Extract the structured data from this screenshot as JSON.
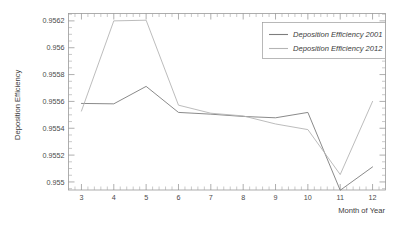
{
  "chart_data": {
    "type": "line",
    "title": "",
    "xlabel": "Month of Year",
    "ylabel": "Deposition Efficiency",
    "x": [
      3,
      4,
      5,
      6,
      7,
      8,
      9,
      10,
      11,
      12
    ],
    "xlim": [
      2.6,
      12.4
    ],
    "ylim": [
      0.95494,
      0.956255
    ],
    "xticks": [
      "3",
      "4",
      "5",
      "6",
      "7",
      "8",
      "9",
      "10",
      "11",
      "12"
    ],
    "yticks": [
      "0.955",
      "0.9552",
      "0.9554",
      "0.9556",
      "0.9558",
      "0.956",
      "0.9562"
    ],
    "ytick_values": [
      0.955,
      0.9552,
      0.9554,
      0.9556,
      0.9558,
      0.956,
      0.9562
    ],
    "grid": false,
    "legend_position": "top-right",
    "series": [
      {
        "name": "Deposition Efficiency 2001",
        "color": "#7d7d7d",
        "values": [
          0.955585,
          0.955582,
          0.955712,
          0.955518,
          0.955505,
          0.955488,
          0.955478,
          0.955518,
          0.954938,
          0.955112
        ]
      },
      {
        "name": "Deposition Efficiency 2012",
        "color": "#b4b4b4",
        "values": [
          0.955528,
          0.9562,
          0.956205,
          0.955572,
          0.955512,
          0.955492,
          0.955432,
          0.95539,
          0.955055,
          0.9556
        ]
      }
    ]
  },
  "axes": {
    "y_title": "Deposition Efficiency",
    "x_title": "Month of Year"
  },
  "legend": {
    "entries": [
      {
        "label": "Deposition Efficiency 2001"
      },
      {
        "label": "Deposition Efficiency 2012"
      }
    ]
  },
  "colors": {
    "series_2001": "#7d7d7d",
    "series_2012": "#b4b4b4",
    "frame": "#9a9a9a",
    "text": "#3c3c3c",
    "background": "#ffffff"
  }
}
